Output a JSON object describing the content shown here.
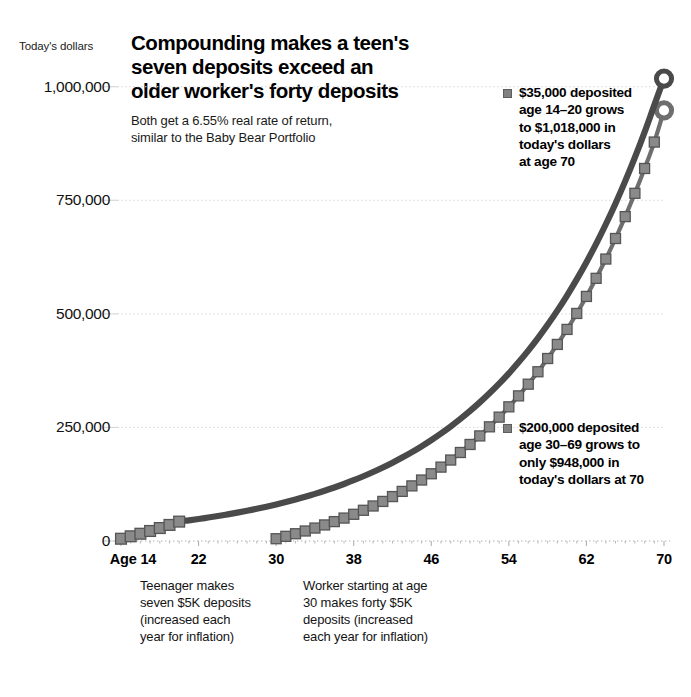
{
  "header": {
    "title_lines": [
      "Compounding makes a teen's",
      "seven deposits exceed an",
      "older worker's forty deposits"
    ],
    "subtitle_lines": [
      "Both get a 6.55% real rate of return,",
      "similar to the Baby Bear Portfolio"
    ],
    "axis_unit_label": "Today's dollars"
  },
  "annotations": [
    {
      "id": "teen-annotation",
      "marker": "square-marker",
      "lines": [
        "$35,000 deposited",
        "age 14–20 grows",
        "to $1,018,000 in",
        "today's dollars",
        "at age 70"
      ]
    },
    {
      "id": "worker-annotation",
      "marker": "square-marker",
      "lines": [
        "$200,000 deposited",
        "age 30–69 grows to",
        "only $948,000 in",
        "today's dollars at 70"
      ]
    }
  ],
  "captions": [
    {
      "id": "teen-caption",
      "lines": [
        "Teenager makes",
        "seven $5K deposits",
        "(increased each",
        "year for inflation)"
      ]
    },
    {
      "id": "worker-caption",
      "lines": [
        "Worker starting at age",
        "30 makes forty $5K",
        "deposits (increased",
        "each year for inflation)"
      ]
    }
  ],
  "colors": {
    "teen_line": "#4a4a4a",
    "worker_line": "#6e6e6e",
    "marker_fill": "#8a8a8a",
    "marker_stroke": "#555555",
    "gridline": "#d8d8d8",
    "baseline": "#b0b0b0",
    "text": "#111111"
  },
  "chart_data": {
    "type": "line",
    "title": "Compounding makes a teen's seven deposits exceed an older worker's forty deposits",
    "subtitle": "Both get a 6.55% real rate of return, similar to the Baby Bear Portfolio",
    "xlabel": "Age",
    "ylabel": "Today's dollars",
    "xlim": [
      14,
      70
    ],
    "ylim": [
      0,
      1050000
    ],
    "xticks": [
      14,
      22,
      30,
      38,
      46,
      54,
      62,
      70
    ],
    "xticklabels": [
      "Age 14",
      "22",
      "30",
      "38",
      "46",
      "54",
      "62",
      "70"
    ],
    "yticks": [
      0,
      250000,
      500000,
      750000,
      1000000
    ],
    "yticklabels": [
      "0",
      "250,000",
      "500,000",
      "750,000",
      "1,000,000"
    ],
    "grid": true,
    "legend": "annotations",
    "rate_of_return_pct": 6.55,
    "series": [
      {
        "name": "Teen saver (deposits age 14-20)",
        "deposit_ages": [
          14,
          15,
          16,
          17,
          18,
          19,
          20
        ],
        "deposit_count": 7,
        "total_deposited": 35000,
        "final_value": 1018000,
        "final_age": 70,
        "marker_ages": [
          14,
          15,
          16,
          17,
          18,
          19,
          20
        ],
        "x": [
          14,
          15,
          16,
          17,
          18,
          19,
          20,
          21,
          22,
          23,
          24,
          25,
          26,
          27,
          28,
          29,
          30,
          31,
          32,
          33,
          34,
          35,
          36,
          37,
          38,
          39,
          40,
          41,
          42,
          43,
          44,
          45,
          46,
          47,
          48,
          49,
          50,
          51,
          52,
          53,
          54,
          55,
          56,
          57,
          58,
          59,
          60,
          61,
          62,
          63,
          64,
          65,
          66,
          67,
          68,
          69,
          70
        ],
        "y": [
          5000,
          10328,
          16004,
          22052,
          28497,
          35365,
          42683,
          45479,
          48458,
          51632,
          55015,
          58619,
          62459,
          66550,
          70910,
          75554,
          80504,
          85778,
          91397,
          97385,
          103765,
          110563,
          117805,
          125521,
          133743,
          142502,
          151836,
          161780,
          172376,
          183666,
          195696,
          208516,
          222175,
          236731,
          252240,
          268767,
          286376,
          305139,
          325130,
          346429,
          369125,
          393309,
          419081,
          446531,
          475819,
          507060,
          540372,
          575892,
          613763,
          654145,
          697202,
          743115,
          792079,
          844301,
          900003,
          959425,
          1018000
        ]
      },
      {
        "name": "Later saver (deposits age 30-69)",
        "deposit_ages": [
          30,
          31,
          32,
          33,
          34,
          35,
          36,
          37,
          38,
          39,
          40,
          41,
          42,
          43,
          44,
          45,
          46,
          47,
          48,
          49,
          50,
          51,
          52,
          53,
          54,
          55,
          56,
          57,
          58,
          59,
          60,
          61,
          62,
          63,
          64,
          65,
          66,
          67,
          68,
          69
        ],
        "deposit_count": 40,
        "total_deposited": 200000,
        "final_value": 948000,
        "final_age": 70,
        "marker_ages": [
          30,
          31,
          32,
          33,
          34,
          35,
          36,
          37,
          38,
          39,
          40,
          41,
          42,
          43,
          44,
          45,
          46,
          47,
          48,
          49,
          50,
          51,
          52,
          53,
          54,
          55,
          56,
          57,
          58,
          59,
          60,
          61,
          62,
          63,
          64,
          65,
          66,
          67,
          68,
          69
        ],
        "x": [
          30,
          31,
          32,
          33,
          34,
          35,
          36,
          37,
          38,
          39,
          40,
          41,
          42,
          43,
          44,
          45,
          46,
          47,
          48,
          49,
          50,
          51,
          52,
          53,
          54,
          55,
          56,
          57,
          58,
          59,
          60,
          61,
          62,
          63,
          64,
          65,
          66,
          67,
          68,
          69,
          70
        ],
        "y": [
          5000,
          10328,
          16004,
          22052,
          28497,
          35365,
          42683,
          50481,
          58788,
          67639,
          77068,
          87111,
          97807,
          109199,
          121330,
          134248,
          148003,
          162648,
          178240,
          194839,
          212510,
          231320,
          251342,
          272655,
          295341,
          319490,
          345196,
          372561,
          401693,
          432708,
          465730,
          500891,
          538330,
          578199,
          620657,
          665876,
          714038,
          765337,
          819981,
          878190,
          948000
        ]
      }
    ]
  }
}
